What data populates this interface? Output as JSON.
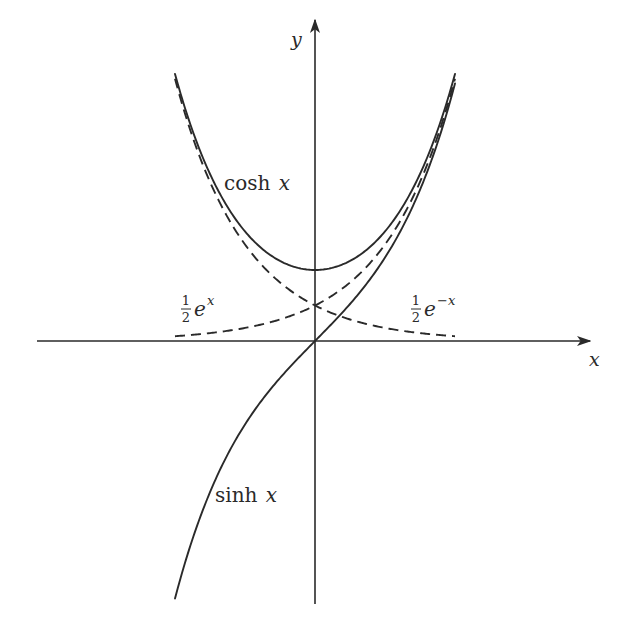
{
  "chart_data": {
    "type": "line",
    "title": "",
    "xlabel": "x",
    "ylabel": "y",
    "xlim": [
      -2,
      2
    ],
    "ylim": [
      -3.7,
      3.8
    ],
    "grid": false,
    "legend": "none (curves labeled inline)",
    "series": [
      {
        "name": "cosh x",
        "function": "cosh",
        "style": "solid",
        "domain": [
          -2,
          2
        ],
        "points": [
          [
            -2,
            3.76
          ],
          [
            -1.5,
            2.35
          ],
          [
            -1,
            1.54
          ],
          [
            -0.5,
            1.13
          ],
          [
            0,
            1.0
          ],
          [
            0.5,
            1.13
          ],
          [
            1,
            1.54
          ],
          [
            1.5,
            2.35
          ],
          [
            2,
            3.76
          ]
        ]
      },
      {
        "name": "sinh x",
        "function": "sinh",
        "style": "solid",
        "domain": [
          -2,
          2
        ],
        "points": [
          [
            -2,
            -3.63
          ],
          [
            -1.5,
            -2.13
          ],
          [
            -1,
            -1.18
          ],
          [
            -0.5,
            -0.52
          ],
          [
            0,
            0.0
          ],
          [
            0.5,
            0.52
          ],
          [
            1,
            1.18
          ],
          [
            1.5,
            2.13
          ],
          [
            2,
            3.63
          ]
        ]
      },
      {
        "name": "1/2 e^x",
        "function": "half_exp",
        "style": "dashed",
        "domain": [
          -2,
          2
        ],
        "points": [
          [
            -2,
            0.07
          ],
          [
            -1.5,
            0.11
          ],
          [
            -1,
            0.18
          ],
          [
            -0.5,
            0.3
          ],
          [
            0,
            0.5
          ],
          [
            0.5,
            0.82
          ],
          [
            1,
            1.36
          ],
          [
            1.5,
            2.24
          ],
          [
            2,
            3.69
          ]
        ]
      },
      {
        "name": "1/2 e^-x",
        "function": "half_exp_neg",
        "style": "dashed",
        "domain": [
          -2,
          2
        ],
        "points": [
          [
            -2,
            3.69
          ],
          [
            -1.5,
            2.24
          ],
          [
            -1,
            1.36
          ],
          [
            -0.5,
            0.82
          ],
          [
            0,
            0.5
          ],
          [
            0.5,
            0.3
          ],
          [
            1,
            0.18
          ],
          [
            1.5,
            0.11
          ],
          [
            2,
            0.07
          ]
        ]
      }
    ],
    "annotations": [
      {
        "text": "cosh x",
        "near": [
          -1.2,
          2.4
        ]
      },
      {
        "text": "sinh x",
        "near": [
          -1.4,
          -2.2
        ]
      },
      {
        "text": "1/2 e^x",
        "near": [
          -1.9,
          0.45
        ]
      },
      {
        "text": "1/2 e^-x",
        "near": [
          1.3,
          0.45
        ]
      }
    ]
  },
  "labels": {
    "x_axis": "x",
    "y_axis": "y",
    "cosh": {
      "fn": "cosh",
      "var": "x"
    },
    "sinh": {
      "fn": "sinh",
      "var": "x"
    },
    "half_exp": {
      "num": "1",
      "den": "2",
      "base": "e",
      "exp": "x"
    },
    "half_exp_neg": {
      "num": "1",
      "den": "2",
      "base": "e",
      "exp": "−x"
    }
  },
  "frame": {
    "origin_px": [
      315,
      341
    ],
    "unit_px_x": 70,
    "unit_px_y": 71,
    "x_axis_px": [
      37,
      590
    ],
    "y_axis_px": [
      604,
      20
    ]
  }
}
